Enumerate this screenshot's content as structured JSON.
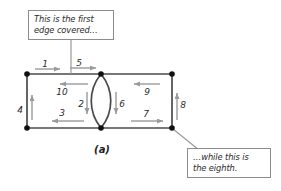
{
  "figure": {
    "panel_label": "(a)",
    "colors": {
      "edge": "#4a4a4a",
      "node": "#111111",
      "arrow": "#9a9a9a",
      "callout_border": "#8c8c8c",
      "callout_leader": "#9a9a9a",
      "text": "#2b2b2b",
      "background": "#ffffff"
    },
    "callouts": [
      {
        "id": "first",
        "text": "This is the first\nedge covered…",
        "points_to": "edge-1"
      },
      {
        "id": "eighth",
        "text": "…while this is\nthe eighth.",
        "points_to": "edge-8"
      }
    ],
    "nodes": [
      {
        "id": "top-left",
        "x": 27,
        "y": 74
      },
      {
        "id": "bottom-left",
        "x": 27,
        "y": 128
      },
      {
        "id": "top-middle",
        "x": 101,
        "y": 74
      },
      {
        "id": "bottom-middle",
        "x": 101,
        "y": 128
      },
      {
        "id": "top-right",
        "x": 172,
        "y": 74
      },
      {
        "id": "bottom-right",
        "x": 172,
        "y": 128
      }
    ],
    "edges": [
      {
        "order": "1",
        "label": "1",
        "from": "top-left",
        "to": "top-middle",
        "direction": "right",
        "side": "above"
      },
      {
        "order": "2",
        "label": "2",
        "from": "top-middle",
        "to": "bottom-middle",
        "direction": "down",
        "side": "left"
      },
      {
        "order": "3",
        "label": "3",
        "from": "bottom-middle",
        "to": "bottom-left",
        "direction": "left",
        "side": "above"
      },
      {
        "order": "4",
        "label": "4",
        "from": "bottom-left",
        "to": "top-left",
        "direction": "up",
        "side": "left"
      },
      {
        "order": "5",
        "label": "5",
        "from": "top-left",
        "to": "top-middle",
        "direction": "right",
        "side": "above"
      },
      {
        "order": "6",
        "label": "6",
        "from": "top-middle",
        "to": "bottom-middle",
        "direction": "down",
        "side": "right"
      },
      {
        "order": "7",
        "label": "7",
        "from": "bottom-middle",
        "to": "bottom-right",
        "direction": "right",
        "side": "above"
      },
      {
        "order": "8",
        "label": "8",
        "from": "bottom-right",
        "to": "top-right",
        "direction": "up",
        "side": "right"
      },
      {
        "order": "9",
        "label": "9",
        "from": "top-right",
        "to": "top-middle",
        "direction": "left",
        "side": "below"
      },
      {
        "order": "10",
        "label": "10",
        "from": "top-middle",
        "to": "top-left",
        "direction": "left",
        "side": "below"
      }
    ],
    "edge_label_positions": {
      "e1": {
        "x": 45,
        "y": 64
      },
      "e5": {
        "x": 79,
        "y": 63
      },
      "e10": {
        "x": 62,
        "y": 92
      },
      "e4": {
        "x": 20,
        "y": 110
      },
      "e3": {
        "x": 62,
        "y": 113
      },
      "e2": {
        "x": 81,
        "y": 104
      },
      "e6": {
        "x": 122,
        "y": 104
      },
      "e9": {
        "x": 147,
        "y": 92
      },
      "e7": {
        "x": 146,
        "y": 114
      },
      "e8": {
        "x": 183,
        "y": 105
      }
    }
  }
}
